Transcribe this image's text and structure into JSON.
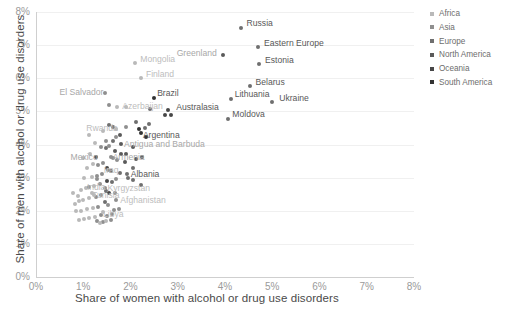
{
  "chart_data": {
    "type": "scatter",
    "title": "",
    "xlabel": "Share of women with alcohol or drug use disorders",
    "ylabel": "Share of men with alcohol or drug use disorders",
    "xlim": [
      0,
      8
    ],
    "ylim": [
      0,
      8
    ],
    "xticks": [
      "0%",
      "1%",
      "2%",
      "3%",
      "4%",
      "5%",
      "6%",
      "7%",
      "8%"
    ],
    "yticks": [
      "0%",
      "1%",
      "2%",
      "3%",
      "4%",
      "5%",
      "6%",
      "7%",
      "8%"
    ],
    "grid": true,
    "legend_position": "right",
    "legend": [
      {
        "label": "Africa",
        "color": "#b9b9b9"
      },
      {
        "label": "Asia",
        "color": "#8f8f8f"
      },
      {
        "label": "Europe",
        "color": "#6f6f6f"
      },
      {
        "label": "North America",
        "color": "#5a5a5a"
      },
      {
        "label": "Oceania",
        "color": "#474747"
      },
      {
        "label": "South America",
        "color": "#333333"
      }
    ],
    "labeled_points": [
      {
        "name": "Russia",
        "x": 4.33,
        "y": 7.52,
        "color": "#6f6f6f",
        "label_style": "dark",
        "dx": 6,
        "dy": -5
      },
      {
        "name": "Eastern Europe",
        "x": 4.7,
        "y": 6.93,
        "color": "#6f6f6f",
        "label_style": "dark",
        "dx": 6,
        "dy": -4
      },
      {
        "name": "Greenland",
        "x": 3.95,
        "y": 6.7,
        "color": "#5a5a5a",
        "label_style": "mid",
        "dx": -46,
        "dy": -2
      },
      {
        "name": "Estonia",
        "x": 4.72,
        "y": 6.43,
        "color": "#6f6f6f",
        "label_style": "dark",
        "dx": 6,
        "dy": -4
      },
      {
        "name": "Belarus",
        "x": 4.52,
        "y": 5.76,
        "color": "#6f6f6f",
        "label_style": "dark",
        "dx": 6,
        "dy": -4
      },
      {
        "name": "Ukraine",
        "x": 5.0,
        "y": 5.29,
        "color": "#6f6f6f",
        "label_style": "dark",
        "dx": 7,
        "dy": -4
      },
      {
        "name": "Lithuania",
        "x": 4.12,
        "y": 5.36,
        "color": "#6f6f6f",
        "label_style": "dark",
        "dx": 4,
        "dy": -5
      },
      {
        "name": "Moldova",
        "x": 4.07,
        "y": 4.78,
        "color": "#6f6f6f",
        "label_style": "dark",
        "dx": 4,
        "dy": -5
      },
      {
        "name": "Mongolia",
        "x": 2.1,
        "y": 6.47,
        "color": "#b9b9b9",
        "label_style": "faint",
        "dx": 5,
        "dy": -4
      },
      {
        "name": "Finland",
        "x": 2.22,
        "y": 6.0,
        "color": "#b9b9b9",
        "label_style": "faint",
        "dx": 5,
        "dy": -4
      },
      {
        "name": "El Salvador",
        "x": 1.47,
        "y": 5.55,
        "color": "#8f8f8f",
        "label_style": "mid",
        "dx": -46,
        "dy": -1
      },
      {
        "name": "Brazil",
        "x": 2.5,
        "y": 5.4,
        "color": "#333333",
        "label_style": "dark",
        "dx": 3,
        "dy": -5
      },
      {
        "name": "Azerbaijan",
        "x": 1.72,
        "y": 5.12,
        "color": "#b9b9b9",
        "label_style": "faint",
        "dx": 5,
        "dy": -1
      },
      {
        "name": "Australasia",
        "x": 2.8,
        "y": 5.03,
        "color": "#474747",
        "label_style": "dark",
        "dx": 8,
        "dy": -3
      },
      {
        "name": "Rwanda",
        "x": 1.7,
        "y": 4.48,
        "color": "#b9b9b9",
        "label_style": "faint",
        "dx": -30,
        "dy": -1
      },
      {
        "name": "Argentina",
        "x": 2.22,
        "y": 4.35,
        "color": "#333333",
        "label_style": "dark",
        "dx": 2,
        "dy": 2
      },
      {
        "name": "Antigua and Barbuda",
        "x": 1.8,
        "y": 4.02,
        "color": "#5a5a5a",
        "label_style": "mid",
        "dx": 3,
        "dy": 0
      },
      {
        "name": "Mexico",
        "x": 1.28,
        "y": 3.62,
        "color": "#5a5a5a",
        "label_style": "mid",
        "dx": -26,
        "dy": 0
      },
      {
        "name": "Armenia",
        "x": 1.58,
        "y": 3.62,
        "color": "#8f8f8f",
        "label_style": "mid",
        "dx": 2,
        "dy": 0
      },
      {
        "name": "Iraq",
        "x": 1.52,
        "y": 3.22,
        "color": "#8f8f8f",
        "label_style": "faint",
        "dx": -4,
        "dy": 0
      },
      {
        "name": "Albania",
        "x": 1.92,
        "y": 3.1,
        "color": "#6f6f6f",
        "label_style": "dark",
        "dx": 4,
        "dy": 0
      },
      {
        "name": "India",
        "x": 1.12,
        "y": 2.72,
        "color": "#8f8f8f",
        "label_style": "faint",
        "dx": -2,
        "dy": 0
      },
      {
        "name": "Kyrgyzstan",
        "x": 1.45,
        "y": 2.7,
        "color": "#8f8f8f",
        "label_style": "faint",
        "dx": 3,
        "dy": 0
      },
      {
        "name": "Tunisia",
        "x": 1.23,
        "y": 2.48,
        "color": "#b9b9b9",
        "label_style": "faint",
        "dx": -2,
        "dy": 0
      },
      {
        "name": "Afghanistan",
        "x": 1.7,
        "y": 2.32,
        "color": "#8f8f8f",
        "label_style": "faint",
        "dx": 4,
        "dy": 0
      },
      {
        "name": "Libya",
        "x": 1.42,
        "y": 1.95,
        "color": "#b9b9b9",
        "label_style": "faint",
        "dx": 0,
        "dy": 2
      }
    ],
    "cluster_points": [
      {
        "x": 1.12,
        "y": 4.3,
        "color": "#b9b9b9"
      },
      {
        "x": 1.55,
        "y": 4.6,
        "color": "#6f6f6f"
      },
      {
        "x": 1.62,
        "y": 4.52,
        "color": "#6f6f6f"
      },
      {
        "x": 2.12,
        "y": 4.68,
        "color": "#6f6f6f"
      },
      {
        "x": 2.18,
        "y": 4.48,
        "color": "#333333"
      },
      {
        "x": 2.3,
        "y": 4.5,
        "color": "#6f6f6f"
      },
      {
        "x": 2.33,
        "y": 4.22,
        "color": "#333333"
      },
      {
        "x": 2.4,
        "y": 4.62,
        "color": "#6f6f6f"
      },
      {
        "x": 2.72,
        "y": 4.88,
        "color": "#474747"
      },
      {
        "x": 2.85,
        "y": 4.9,
        "color": "#474747"
      },
      {
        "x": 1.48,
        "y": 4.1,
        "color": "#8f8f8f"
      },
      {
        "x": 1.62,
        "y": 4.12,
        "color": "#6f6f6f"
      },
      {
        "x": 1.7,
        "y": 4.22,
        "color": "#8f8f8f"
      },
      {
        "x": 1.78,
        "y": 4.3,
        "color": "#5a5a5a"
      },
      {
        "x": 1.38,
        "y": 3.92,
        "color": "#8f8f8f"
      },
      {
        "x": 1.48,
        "y": 3.88,
        "color": "#6f6f6f"
      },
      {
        "x": 1.55,
        "y": 3.95,
        "color": "#8f8f8f"
      },
      {
        "x": 1.68,
        "y": 3.8,
        "color": "#5a5a5a"
      },
      {
        "x": 1.8,
        "y": 3.72,
        "color": "#5a5a5a"
      },
      {
        "x": 1.9,
        "y": 3.7,
        "color": "#5a5a5a"
      },
      {
        "x": 1.62,
        "y": 3.58,
        "color": "#8f8f8f"
      },
      {
        "x": 1.72,
        "y": 3.52,
        "color": "#8f8f8f"
      },
      {
        "x": 1.88,
        "y": 3.48,
        "color": "#5a5a5a"
      },
      {
        "x": 1.42,
        "y": 3.45,
        "color": "#8f8f8f"
      },
      {
        "x": 1.32,
        "y": 3.38,
        "color": "#8f8f8f"
      },
      {
        "x": 1.2,
        "y": 3.4,
        "color": "#b9b9b9"
      },
      {
        "x": 1.08,
        "y": 3.3,
        "color": "#b9b9b9"
      },
      {
        "x": 1.5,
        "y": 3.3,
        "color": "#474747"
      },
      {
        "x": 1.58,
        "y": 3.2,
        "color": "#6f6f6f"
      },
      {
        "x": 1.4,
        "y": 3.12,
        "color": "#8f8f8f"
      },
      {
        "x": 1.3,
        "y": 3.05,
        "color": "#8f8f8f"
      },
      {
        "x": 1.18,
        "y": 3.02,
        "color": "#b9b9b9"
      },
      {
        "x": 1.02,
        "y": 3.0,
        "color": "#b9b9b9"
      },
      {
        "x": 1.95,
        "y": 2.98,
        "color": "#6f6f6f"
      },
      {
        "x": 2.05,
        "y": 2.92,
        "color": "#6f6f6f"
      },
      {
        "x": 2.22,
        "y": 2.78,
        "color": "#6f6f6f"
      },
      {
        "x": 1.5,
        "y": 2.9,
        "color": "#474747"
      },
      {
        "x": 1.6,
        "y": 2.86,
        "color": "#6f6f6f"
      },
      {
        "x": 1.35,
        "y": 2.8,
        "color": "#8f8f8f"
      },
      {
        "x": 1.22,
        "y": 2.75,
        "color": "#b9b9b9"
      },
      {
        "x": 1.05,
        "y": 2.68,
        "color": "#b9b9b9"
      },
      {
        "x": 0.95,
        "y": 2.62,
        "color": "#b9b9b9"
      },
      {
        "x": 1.48,
        "y": 2.6,
        "color": "#6f6f6f"
      },
      {
        "x": 1.55,
        "y": 2.55,
        "color": "#474747"
      },
      {
        "x": 1.38,
        "y": 2.48,
        "color": "#8f8f8f"
      },
      {
        "x": 1.28,
        "y": 2.42,
        "color": "#8f8f8f"
      },
      {
        "x": 1.12,
        "y": 2.38,
        "color": "#b9b9b9"
      },
      {
        "x": 1.0,
        "y": 2.32,
        "color": "#b9b9b9"
      },
      {
        "x": 0.9,
        "y": 2.28,
        "color": "#b9b9b9"
      },
      {
        "x": 0.82,
        "y": 2.2,
        "color": "#b9b9b9"
      },
      {
        "x": 1.45,
        "y": 2.25,
        "color": "#6f6f6f"
      },
      {
        "x": 1.52,
        "y": 2.18,
        "color": "#8f8f8f"
      },
      {
        "x": 1.32,
        "y": 2.12,
        "color": "#8f8f8f"
      },
      {
        "x": 1.2,
        "y": 2.08,
        "color": "#b9b9b9"
      },
      {
        "x": 1.08,
        "y": 2.05,
        "color": "#b9b9b9"
      },
      {
        "x": 0.95,
        "y": 2.0,
        "color": "#b9b9b9"
      },
      {
        "x": 0.85,
        "y": 1.98,
        "color": "#b9b9b9"
      },
      {
        "x": 1.38,
        "y": 1.88,
        "color": "#8f8f8f"
      },
      {
        "x": 1.5,
        "y": 1.85,
        "color": "#8f8f8f"
      },
      {
        "x": 1.6,
        "y": 1.9,
        "color": "#8f8f8f"
      },
      {
        "x": 1.25,
        "y": 1.8,
        "color": "#b9b9b9"
      },
      {
        "x": 1.12,
        "y": 1.78,
        "color": "#b9b9b9"
      },
      {
        "x": 1.02,
        "y": 1.75,
        "color": "#b9b9b9"
      },
      {
        "x": 0.92,
        "y": 1.72,
        "color": "#b9b9b9"
      },
      {
        "x": 1.3,
        "y": 1.68,
        "color": "#8f8f8f"
      },
      {
        "x": 1.42,
        "y": 1.65,
        "color": "#8f8f8f"
      },
      {
        "x": 0.88,
        "y": 2.45,
        "color": "#b9b9b9"
      },
      {
        "x": 0.78,
        "y": 2.55,
        "color": "#b9b9b9"
      },
      {
        "x": 1.0,
        "y": 3.6,
        "color": "#b9b9b9"
      },
      {
        "x": 1.15,
        "y": 3.72,
        "color": "#b9b9b9"
      },
      {
        "x": 1.25,
        "y": 4.05,
        "color": "#b9b9b9"
      },
      {
        "x": 1.9,
        "y": 4.52,
        "color": "#8f8f8f"
      },
      {
        "x": 2.05,
        "y": 3.92,
        "color": "#5a5a5a"
      },
      {
        "x": 2.12,
        "y": 3.55,
        "color": "#5a5a5a"
      },
      {
        "x": 2.25,
        "y": 3.62,
        "color": "#5a5a5a"
      },
      {
        "x": 2.05,
        "y": 3.3,
        "color": "#6f6f6f"
      },
      {
        "x": 1.78,
        "y": 3.15,
        "color": "#6f6f6f"
      },
      {
        "x": 1.7,
        "y": 2.95,
        "color": "#8f8f8f"
      },
      {
        "x": 1.68,
        "y": 2.55,
        "color": "#8f8f8f"
      },
      {
        "x": 1.75,
        "y": 2.05,
        "color": "#8f8f8f"
      },
      {
        "x": 1.65,
        "y": 2.02,
        "color": "#8f8f8f"
      },
      {
        "x": 1.58,
        "y": 1.72,
        "color": "#8f8f8f"
      },
      {
        "x": 1.48,
        "y": 1.7,
        "color": "#b9b9b9"
      },
      {
        "x": 1.35,
        "y": 1.62,
        "color": "#b9b9b9"
      },
      {
        "x": 1.55,
        "y": 5.18,
        "color": "#8f8f8f"
      },
      {
        "x": 1.9,
        "y": 5.12,
        "color": "#b9b9b9"
      },
      {
        "x": 2.42,
        "y": 5.08,
        "color": "#6f6f6f"
      },
      {
        "x": 1.42,
        "y": 4.42,
        "color": "#b9b9b9"
      },
      {
        "x": 1.3,
        "y": 2.95,
        "color": "#8f8f8f"
      },
      {
        "x": 1.18,
        "y": 2.55,
        "color": "#b9b9b9"
      }
    ]
  }
}
